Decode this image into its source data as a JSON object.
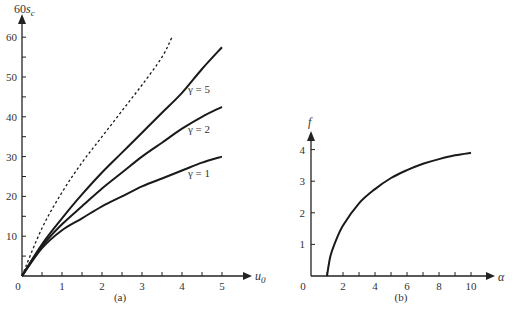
{
  "chart_data": [
    {
      "type": "line",
      "panel_label": "(a)",
      "xlabel": "u0",
      "xlabel_main": "u",
      "xlabel_sub": "0",
      "ylabel": "60s_c",
      "ylabel_main": "60s",
      "ylabel_sub": "c",
      "xlim": [
        0,
        5.5
      ],
      "ylim": [
        0,
        62
      ],
      "x_ticks": [
        0,
        1,
        2,
        3,
        4,
        5
      ],
      "x_tick_labels": [
        "0",
        "1",
        "2",
        "3",
        "4",
        "5"
      ],
      "y_ticks": [
        10,
        20,
        30,
        40,
        50,
        60
      ],
      "y_tick_labels": [
        "10",
        "20",
        "30",
        "40",
        "50",
        "60"
      ],
      "grid": false,
      "series": [
        {
          "name": "dashed (limit)",
          "style": "dashed",
          "x": [
            0,
            0.5,
            1,
            1.5,
            2,
            2.5,
            3,
            3.5,
            3.75
          ],
          "y": [
            0,
            12,
            21,
            28.5,
            35,
            41.5,
            48,
            55,
            60
          ]
        },
        {
          "name": "γ = 5",
          "style": "solid",
          "x": [
            0,
            0.5,
            1,
            1.5,
            2,
            2.5,
            3,
            3.5,
            4,
            4.5,
            5
          ],
          "y": [
            0,
            8,
            14.5,
            20.5,
            26,
            31,
            36,
            41,
            46,
            52,
            57.5
          ]
        },
        {
          "name": "γ = 2",
          "style": "solid",
          "x": [
            0,
            0.5,
            1,
            1.5,
            2,
            2.5,
            3,
            3.5,
            4,
            4.5,
            5
          ],
          "y": [
            0,
            7.5,
            13,
            17.5,
            22,
            26,
            30,
            33.5,
            37,
            40,
            42.5
          ]
        },
        {
          "name": "γ = 1",
          "style": "solid",
          "x": [
            0,
            0.5,
            1,
            1.5,
            2,
            2.5,
            3,
            3.5,
            4,
            4.5,
            5
          ],
          "y": [
            0,
            7,
            11.5,
            14.5,
            17.5,
            20,
            22.5,
            24.5,
            26.5,
            28.5,
            30
          ]
        }
      ],
      "annotations": [
        "γ = 5",
        "γ = 2",
        "γ = 1"
      ]
    },
    {
      "type": "line",
      "panel_label": "(b)",
      "xlabel": "α",
      "ylabel": "f",
      "xlim": [
        0,
        11
      ],
      "ylim": [
        0,
        4.5
      ],
      "x_ticks": [
        0,
        2,
        4,
        6,
        8,
        10
      ],
      "x_tick_labels": [
        "0",
        "2",
        "4",
        "6",
        "8",
        "10"
      ],
      "y_ticks": [
        1,
        2,
        3,
        4
      ],
      "y_tick_labels": [
        "1",
        "2",
        "3",
        "4"
      ],
      "grid": false,
      "series": [
        {
          "name": "f(α)",
          "style": "solid",
          "x": [
            1,
            1.2,
            1.5,
            2,
            3,
            4,
            5,
            6,
            7,
            8,
            9,
            10
          ],
          "y": [
            0,
            0.6,
            1.05,
            1.6,
            2.3,
            2.75,
            3.1,
            3.35,
            3.55,
            3.7,
            3.82,
            3.9
          ]
        }
      ]
    }
  ]
}
